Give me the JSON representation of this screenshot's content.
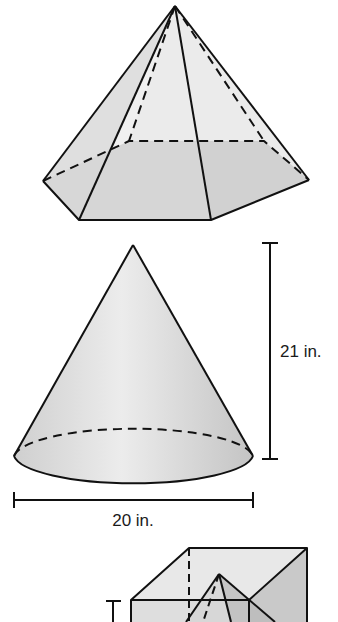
{
  "figures": [
    {
      "id": "hexagonal-pyramid",
      "type": "hexagonal pyramid"
    },
    {
      "id": "cone",
      "type": "cone",
      "height_label": "21 in.",
      "diameter_label": "20 in."
    },
    {
      "id": "cube-with-pyramid",
      "type": "cube containing pyramid (cropped)"
    }
  ],
  "colors": {
    "stroke": "#111111",
    "face_light": "#e6e6e6",
    "face_mid": "#d2d2d2",
    "face_dark": "#bdbdbd"
  }
}
